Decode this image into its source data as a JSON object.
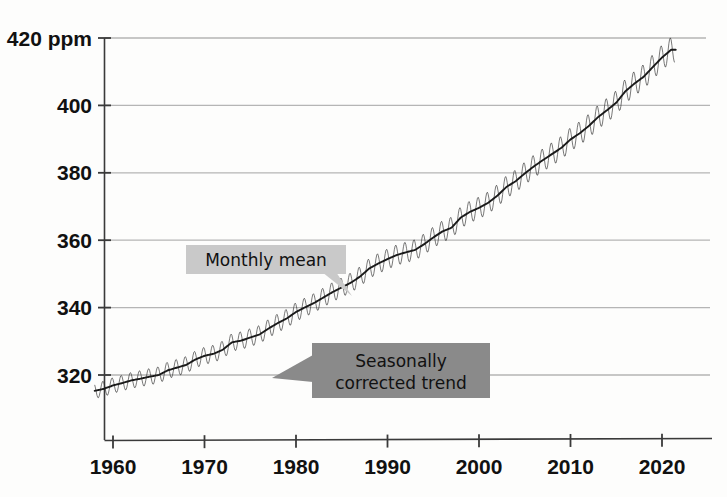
{
  "chart_data": {
    "type": "line",
    "title": "",
    "subtitle": "",
    "xlabel": "",
    "ylabel": "420 ppm",
    "xlim": [
      1958,
      2021.5
    ],
    "ylim": [
      312,
      420
    ],
    "grid": true,
    "legend_position": "inline-callouts",
    "x_ticks": [
      1960,
      1970,
      1980,
      1990,
      2000,
      2010,
      2020
    ],
    "x_tick_labels": [
      "1960",
      "1970",
      "1980",
      "1990",
      "2000",
      "2010",
      "2020"
    ],
    "y_ticks": [
      320,
      340,
      360,
      380,
      400,
      420
    ],
    "y_tick_labels": [
      "320",
      "340",
      "360",
      "380",
      "400",
      "420 ppm"
    ],
    "annotations": [
      {
        "name": "monthly-mean",
        "text": "Monthly mean",
        "box_fill": "#c9c9c9",
        "text_color": "#111111",
        "points_to": [
          1989.5,
          352
        ]
      },
      {
        "name": "seasonally-corrected-trend",
        "text_line1": "Seasonally",
        "text_line2": "corrected trend",
        "box_fill": "#8a8a8a",
        "text_color": "#101010",
        "points_to": [
          1976.5,
          331
        ]
      }
    ],
    "series": [
      {
        "name": "Monthly mean",
        "color": "#2b2b2b",
        "style": "sawtooth-overlay",
        "seasonal_amplitude_ppm": 3.2,
        "description": "Monthly mean CO2 with seasonal cycle superimposed on trend"
      },
      {
        "name": "Seasonally corrected trend",
        "color": "#1a1a1a",
        "style": "smooth",
        "x": [
          1958,
          1959,
          1960,
          1961,
          1962,
          1963,
          1964,
          1965,
          1966,
          1967,
          1968,
          1969,
          1970,
          1971,
          1972,
          1973,
          1974,
          1975,
          1976,
          1977,
          1978,
          1979,
          1980,
          1981,
          1982,
          1983,
          1984,
          1985,
          1986,
          1987,
          1988,
          1989,
          1990,
          1991,
          1992,
          1993,
          1994,
          1995,
          1996,
          1997,
          1998,
          1999,
          2000,
          2001,
          2002,
          2003,
          2004,
          2005,
          2006,
          2007,
          2008,
          2009,
          2010,
          2011,
          2012,
          2013,
          2014,
          2015,
          2016,
          2017,
          2018,
          2019,
          2020,
          2021
        ],
        "values": [
          315.3,
          315.9,
          316.9,
          317.6,
          318.4,
          318.9,
          319.5,
          320.0,
          321.4,
          322.2,
          323.0,
          324.6,
          325.7,
          326.3,
          327.5,
          329.7,
          330.2,
          331.1,
          332.0,
          333.8,
          335.4,
          336.8,
          338.7,
          340.1,
          341.4,
          343.0,
          344.6,
          346.0,
          347.4,
          349.2,
          351.6,
          353.1,
          354.4,
          355.6,
          356.4,
          357.1,
          358.8,
          360.8,
          362.6,
          363.7,
          366.7,
          368.4,
          369.6,
          371.1,
          373.2,
          375.8,
          377.5,
          379.8,
          381.9,
          383.8,
          385.6,
          387.4,
          389.9,
          391.7,
          393.9,
          396.5,
          398.6,
          400.8,
          404.2,
          406.5,
          408.5,
          411.4,
          414.2,
          416.5
        ]
      }
    ]
  },
  "colors": {
    "background": "#fdfdfc",
    "axis": "#3a3a3a",
    "gridline": "#b5b5b5",
    "curve": "#2b2b2b",
    "callout_light": "#c9c9c9",
    "callout_dark": "#8a8a8a"
  }
}
